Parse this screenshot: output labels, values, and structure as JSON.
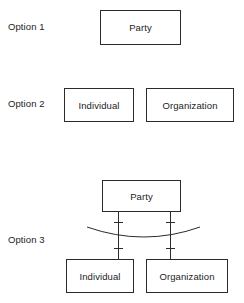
{
  "diagram": {
    "background_color": "#ffffff",
    "line_color": "#2b2b2b",
    "text_color": "#1c1c1c",
    "options": [
      {
        "label": "Option 1",
        "entities": [
          {
            "name": "Party"
          }
        ]
      },
      {
        "label": "Option 2",
        "entities": [
          {
            "name": "Individual"
          },
          {
            "name": "Organization"
          }
        ]
      },
      {
        "label": "Option 3",
        "entities": [
          {
            "name": "Party"
          },
          {
            "name": "Individual"
          },
          {
            "name": "Organization"
          }
        ],
        "relationships": {
          "style": "exclusive-arc",
          "tick_marks": 4,
          "connector_count": 2
        }
      }
    ]
  },
  "labels": {
    "option1": "Option 1",
    "option2": "Option 2",
    "option3": "Option 3"
  },
  "boxes": {
    "opt1_party": "Party",
    "opt2_individual": "Individual",
    "opt2_organization": "Organization",
    "opt3_party": "Party",
    "opt3_individual": "Individual",
    "opt3_organization": "Organization"
  }
}
